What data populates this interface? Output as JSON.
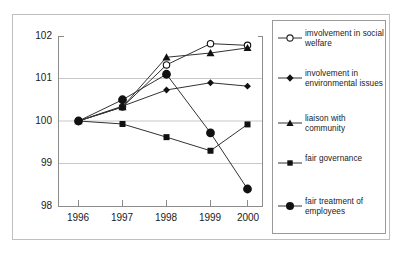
{
  "chart_data": {
    "type": "line",
    "title": "",
    "xlabel": "",
    "ylabel": "",
    "x": [
      "1996",
      "1997",
      "1998",
      "1999",
      "2000"
    ],
    "categories": [
      "1996",
      "1997",
      "1998",
      "1999",
      "2000"
    ],
    "ylim": [
      98,
      102
    ],
    "yticks": [
      98,
      99,
      100,
      101,
      102
    ],
    "ytick_labels": [
      "98",
      "99",
      "100",
      "101",
      "102"
    ],
    "grid": "horizontal",
    "legend_position": "right",
    "series": [
      {
        "name": "imvolvement in social welfare",
        "marker": "open-circle",
        "values": [
          100.0,
          100.33,
          101.32,
          101.82,
          101.78
        ]
      },
      {
        "name": "involvement in environmental issues",
        "marker": "diamond",
        "values": [
          100.0,
          100.35,
          100.73,
          100.9,
          100.82
        ]
      },
      {
        "name": "liaison with community",
        "marker": "triangle",
        "values": [
          100.0,
          100.33,
          101.5,
          101.6,
          101.72
        ]
      },
      {
        "name": "fair governance",
        "marker": "square",
        "values": [
          100.0,
          99.93,
          99.62,
          99.3,
          99.92
        ]
      },
      {
        "name": "fair treatment of employees",
        "marker": "filled-circle",
        "values": [
          100.0,
          100.5,
          101.1,
          99.72,
          98.4
        ]
      }
    ],
    "colors": {
      "line": "#333333",
      "marker": "#111111",
      "grid": "#c8c8c8",
      "axis": "#8c8c8c",
      "frame": "#bfbfbf",
      "background": "#ffffff"
    }
  },
  "axis": {
    "y_tick_labels": [
      "102",
      "101",
      "100",
      "99",
      "98"
    ],
    "x_tick_labels": [
      "1996",
      "1997",
      "1998",
      "1999",
      "2000"
    ]
  },
  "legend": {
    "items": [
      {
        "label": "imvolvement in social welfare",
        "marker": "open-circle"
      },
      {
        "label": "involvement in environmental issues",
        "marker": "diamond"
      },
      {
        "label": "liaison with community",
        "marker": "triangle"
      },
      {
        "label": "fair governance",
        "marker": "square"
      },
      {
        "label": "fair treatment of employees",
        "marker": "filled-circle"
      }
    ]
  }
}
